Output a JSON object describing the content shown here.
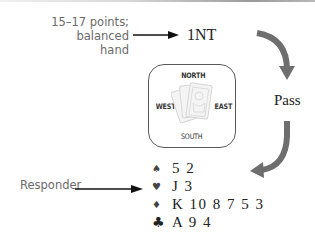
{
  "annotations": {
    "opener_note_line1": "15–17 points;",
    "opener_note_line2": "balanced hand",
    "responder_note": "Responder"
  },
  "bids": {
    "opener": "1NT",
    "next": "Pass"
  },
  "table": {
    "north": "NORTH",
    "south": "SOUTH",
    "west": "WEST",
    "east": "EAST",
    "center_icon": "playing-cards-icon"
  },
  "hand": {
    "spades": {
      "suit_icon": "spade-icon",
      "glyph": "♠",
      "cards": "5 2"
    },
    "hearts": {
      "suit_icon": "heart-icon",
      "glyph": "♥",
      "cards": "J 3"
    },
    "diamonds": {
      "suit_icon": "diamond-icon",
      "glyph": "♦",
      "cards": "K 10 8 7 5 3"
    },
    "clubs": {
      "suit_icon": "club-icon",
      "glyph": "♣",
      "cards": "A 9 4"
    }
  },
  "colors": {
    "curved_arrow": "#6e6e6e",
    "pointer_arrow": "#111111",
    "annotation_text": "#6a6a6a"
  }
}
